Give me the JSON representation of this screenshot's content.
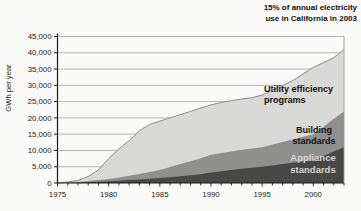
{
  "annotation": {
    "line1": "15% of annual electricity",
    "line2": "use in California in 2003"
  },
  "series_labels": {
    "utility_line1": "Utility efficiency",
    "utility_line2": "programs",
    "building_line1": "Building",
    "building_line2": "standards",
    "appliance_line1": "Appliance",
    "appliance_line2": "standards"
  },
  "colors": {
    "utility_area": "#d9d9d7",
    "building_area": "#8f8f8d",
    "appliance_area": "#474745",
    "grid": "#9a9a98",
    "axis": "#1a1a1a",
    "top_stroke": "#8c8c8a",
    "tick_text": "#1a1a1a",
    "appliance_label_text": "#d6d6d4"
  },
  "chart_data": {
    "type": "area",
    "stacked": true,
    "title": "",
    "xlabel": "",
    "ylabel": "GWh per year",
    "annotation": "15% of annual electricity use in California in 2003",
    "grid": "horizontal gridlines at each 5,000 GWh",
    "legend_position": "labels inside plot areas",
    "xlim": [
      1975,
      2003
    ],
    "ylim": [
      0,
      45000
    ],
    "y_tick_step": 5000,
    "y_tick_labels": [
      "0",
      "5,000",
      "10,000",
      "15,000",
      "20,000",
      "25,000",
      "30,000",
      "35,000",
      "40,000",
      "45,000"
    ],
    "x_tick_labels": [
      "1975",
      "1980",
      "1985",
      "1990",
      "1995",
      "2000"
    ],
    "minor_x_ticks_every_year": true,
    "x": [
      1975,
      1976,
      1977,
      1978,
      1979,
      1980,
      1981,
      1982,
      1983,
      1984,
      1985,
      1986,
      1987,
      1988,
      1989,
      1990,
      1991,
      1992,
      1993,
      1994,
      1995,
      1996,
      1997,
      1998,
      1999,
      2000,
      2001,
      2002,
      2003
    ],
    "series": [
      {
        "name": "Appliance standards",
        "values": [
          0,
          50,
          150,
          300,
          400,
          500,
          700,
          900,
          1100,
          1300,
          1500,
          1800,
          2100,
          2400,
          2700,
          3200,
          3600,
          4000,
          4400,
          4700,
          5000,
          5400,
          5800,
          6200,
          6600,
          7000,
          8300,
          9700,
          11000
        ]
      },
      {
        "name": "Building standards",
        "values": [
          0,
          50,
          150,
          300,
          500,
          700,
          1000,
          1350,
          1700,
          2100,
          2500,
          3100,
          3700,
          4300,
          4900,
          5500,
          5600,
          5700,
          5800,
          5900,
          6000,
          6400,
          6800,
          7200,
          7600,
          8000,
          9000,
          10000,
          11000
        ]
      },
      {
        "name": "Utility efficiency programs",
        "values": [
          0,
          250,
          500,
          1400,
          3100,
          6300,
          8800,
          10750,
          13200,
          14600,
          15000,
          15100,
          15200,
          15300,
          15400,
          15300,
          15500,
          15600,
          15600,
          15600,
          16000,
          16700,
          17400,
          18100,
          19300,
          20500,
          19700,
          18800,
          19000
        ]
      }
    ]
  }
}
